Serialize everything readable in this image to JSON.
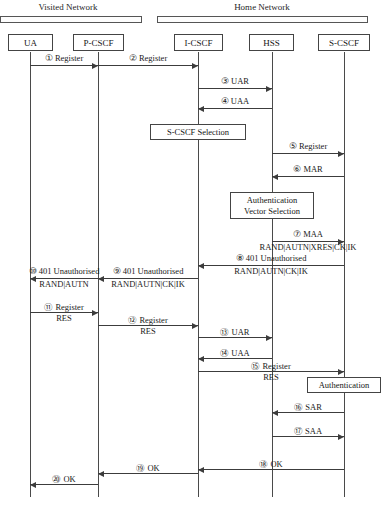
{
  "diagram": {
    "type": "uml-sequence-diagram",
    "caption": "",
    "networks": [
      {
        "id": "visited",
        "label": "Visited Network",
        "bar_x": 0,
        "bar_width": 142,
        "label_x": 68
      },
      {
        "id": "home",
        "label": "Home Network",
        "bar_x": 157,
        "bar_width": 211,
        "label_x": 262
      }
    ],
    "actors": [
      {
        "id": "ua",
        "label": "UA",
        "x": 30,
        "box_left": 8,
        "box_width": 45
      },
      {
        "id": "p-cscf",
        "label": "P-CSCF",
        "x": 98,
        "box_left": 73,
        "box_width": 51
      },
      {
        "id": "i-cscf",
        "label": "I-CSCF",
        "x": 198,
        "box_left": 174,
        "box_width": 49
      },
      {
        "id": "hss",
        "label": "HSS",
        "x": 272,
        "box_left": 249,
        "box_width": 45
      },
      {
        "id": "s-cscf",
        "label": "S-CSCF",
        "x": 344,
        "box_left": 318,
        "box_width": 52
      }
    ],
    "messages": [
      {
        "num": "①",
        "label": "Register",
        "payload": "",
        "from": "ua",
        "to": "p-cscf",
        "y": 65,
        "dir": "right"
      },
      {
        "num": "②",
        "label": "Register",
        "payload": "",
        "from": "p-cscf",
        "to": "i-cscf",
        "y": 65,
        "dir": "right"
      },
      {
        "num": "③",
        "label": "UAR",
        "payload": "",
        "from": "i-cscf",
        "to": "hss",
        "y": 88,
        "dir": "right"
      },
      {
        "num": "④",
        "label": "UAA",
        "payload": "",
        "from": "hss",
        "to": "i-cscf",
        "y": 108,
        "dir": "left"
      },
      {
        "num": "⑤",
        "label": "Register",
        "payload": "",
        "from": "hss",
        "to": "s-cscf",
        "y": 153,
        "dir": "right"
      },
      {
        "num": "⑥",
        "label": "MAR",
        "payload": "",
        "from": "s-cscf",
        "to": "hss",
        "y": 176,
        "dir": "left"
      },
      {
        "num": "⑦",
        "label": "MAA",
        "payload": "RAND|AUTN|XRES|CK|IK",
        "from": "hss",
        "to": "s-cscf",
        "y": 241,
        "dir": "right"
      },
      {
        "num": "⑧",
        "label": "401 Unauthorised",
        "payload": "RAND|AUTN|CK|IK",
        "from": "s-cscf",
        "to": "i-cscf",
        "y": 265,
        "dir": "left"
      },
      {
        "num": "⑨",
        "label": "401 Unauthorised",
        "payload": "RAND|AUTN|CK|IK",
        "from": "i-cscf",
        "to": "p-cscf",
        "y": 278,
        "dir": "left"
      },
      {
        "num": "⑩",
        "label": "401 Unauthorised",
        "payload": "RAND|AUTN",
        "from": "p-cscf",
        "to": "ua",
        "y": 278,
        "dir": "left"
      },
      {
        "num": "⑪",
        "label": "Register",
        "payload": "RES",
        "from": "ua",
        "to": "p-cscf",
        "y": 312,
        "dir": "right"
      },
      {
        "num": "⑫",
        "label": "Register",
        "payload": "RES",
        "from": "p-cscf",
        "to": "i-cscf",
        "y": 325,
        "dir": "right"
      },
      {
        "num": "⑬",
        "label": "UAR",
        "payload": "",
        "from": "i-cscf",
        "to": "hss",
        "y": 337,
        "dir": "right"
      },
      {
        "num": "⑭",
        "label": "UAA",
        "payload": "",
        "from": "hss",
        "to": "i-cscf",
        "y": 358,
        "dir": "left"
      },
      {
        "num": "⑮",
        "label": "Register",
        "payload": "RES",
        "from": "i-cscf",
        "to": "s-cscf",
        "y": 371,
        "dir": "right"
      },
      {
        "num": "⑯",
        "label": "SAR",
        "payload": "",
        "from": "s-cscf",
        "to": "hss",
        "y": 412,
        "dir": "left"
      },
      {
        "num": "⑰",
        "label": "SAA",
        "payload": "",
        "from": "hss",
        "to": "s-cscf",
        "y": 436,
        "dir": "right"
      },
      {
        "num": "⑱",
        "label": "OK",
        "payload": "",
        "from": "s-cscf",
        "to": "i-cscf",
        "y": 469,
        "dir": "left"
      },
      {
        "num": "⑲",
        "label": "OK",
        "payload": "",
        "from": "i-cscf",
        "to": "p-cscf",
        "y": 473,
        "dir": "left"
      },
      {
        "num": "⑳",
        "label": "OK",
        "payload": "",
        "from": "p-cscf",
        "to": "ua",
        "y": 484,
        "dir": "left"
      }
    ],
    "notes": [
      {
        "id": "s-cscf-selection",
        "lines": [
          "S-CSCF Selection"
        ],
        "center_x": 198,
        "y": 124,
        "width": 96,
        "height": 16
      },
      {
        "id": "authentication-vector-selection",
        "lines": [
          "Authentication",
          "Vector Selection"
        ],
        "center_x": 272,
        "y": 192,
        "width": 84,
        "height": 27
      },
      {
        "id": "authentication",
        "lines": [
          "Authentication"
        ],
        "center_x": 344,
        "y": 377,
        "width": 74,
        "height": 16
      }
    ]
  }
}
